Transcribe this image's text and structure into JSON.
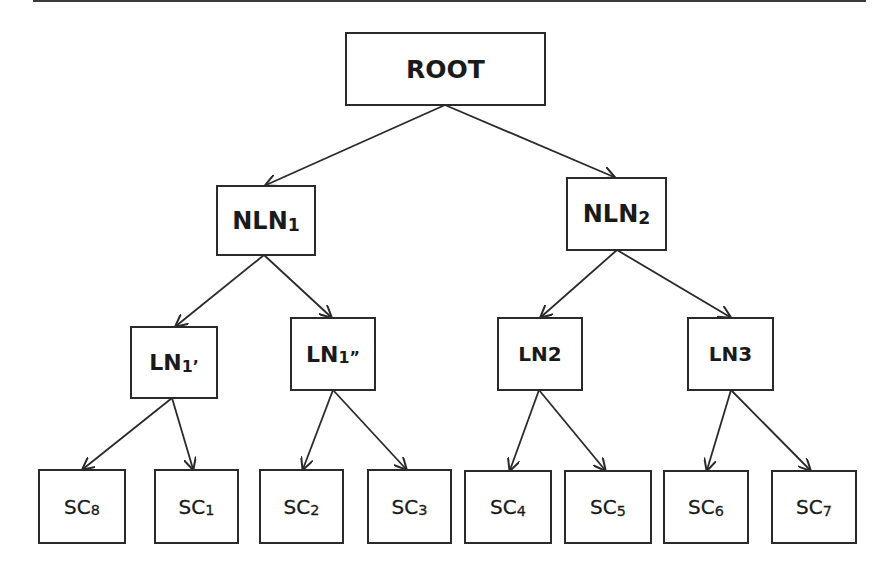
{
  "diagram": {
    "type": "tree",
    "stroke_color": "#2a2a2a",
    "background": "#ffffff",
    "nodes": {
      "root": {
        "id": "ROOT",
        "main": "ROOT",
        "sub": ""
      },
      "nln1": {
        "id": "NLN1",
        "main": "NLN",
        "sub": "1"
      },
      "nln2": {
        "id": "NLN2",
        "main": "NLN",
        "sub": "2"
      },
      "ln1p": {
        "id": "LN1'",
        "main": "LN",
        "sub": "1’"
      },
      "ln1pp": {
        "id": "LN1''",
        "main": "LN",
        "sub": "1”"
      },
      "ln2": {
        "id": "LN2",
        "main": "LN2",
        "sub": ""
      },
      "ln3": {
        "id": "LN3",
        "main": "LN3",
        "sub": ""
      },
      "sc8": {
        "id": "SC8",
        "main": "SC",
        "sub": "8"
      },
      "sc1": {
        "id": "SC1",
        "main": "SC",
        "sub": "1"
      },
      "sc2": {
        "id": "SC2",
        "main": "SC",
        "sub": "2"
      },
      "sc3": {
        "id": "SC3",
        "main": "SC",
        "sub": "3"
      },
      "sc4": {
        "id": "SC4",
        "main": "SC",
        "sub": "4"
      },
      "sc5": {
        "id": "SC5",
        "main": "SC",
        "sub": "5"
      },
      "sc6": {
        "id": "SC6",
        "main": "SC",
        "sub": "6"
      },
      "sc7": {
        "id": "SC7",
        "main": "SC",
        "sub": "7"
      }
    },
    "edges": [
      {
        "from": "ROOT",
        "to": "NLN1"
      },
      {
        "from": "ROOT",
        "to": "NLN2"
      },
      {
        "from": "NLN1",
        "to": "LN1'"
      },
      {
        "from": "NLN1",
        "to": "LN1''"
      },
      {
        "from": "NLN2",
        "to": "LN2"
      },
      {
        "from": "NLN2",
        "to": "LN3"
      },
      {
        "from": "LN1'",
        "to": "SC8"
      },
      {
        "from": "LN1'",
        "to": "SC1"
      },
      {
        "from": "LN1''",
        "to": "SC2"
      },
      {
        "from": "LN1''",
        "to": "SC3"
      },
      {
        "from": "LN2",
        "to": "SC4"
      },
      {
        "from": "LN2",
        "to": "SC5"
      },
      {
        "from": "LN3",
        "to": "SC6"
      },
      {
        "from": "LN3",
        "to": "SC7"
      }
    ]
  }
}
